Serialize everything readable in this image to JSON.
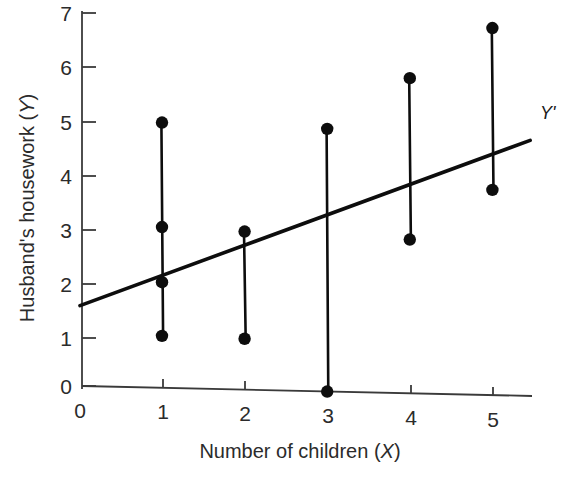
{
  "figure": {
    "name": "scatterplot-with-regression-line",
    "background_color": "#ffffff",
    "ink_color": "#0d0d0d"
  },
  "chart_data": {
    "type": "scatter",
    "title": "",
    "xlabel": "Number of children (X)",
    "ylabel": "Husband's housework (Y)",
    "xlabel_plain": "Number of children",
    "xlabel_italic_symbol": "X",
    "ylabel_plain": "Husband's housework",
    "ylabel_italic_symbol": "Y",
    "xlim": [
      0,
      5.45
    ],
    "ylim": [
      -0.15,
      7
    ],
    "xticks": [
      0,
      1,
      2,
      3,
      4,
      5
    ],
    "xtick_labels": [
      "0",
      "1",
      "2",
      "3",
      "4",
      "5"
    ],
    "yticks": [
      0,
      1,
      2,
      3,
      4,
      5,
      6,
      7
    ],
    "ytick_labels": [
      "0",
      "1",
      "2",
      "3",
      "4",
      "5",
      "6",
      "7"
    ],
    "grid": false,
    "legend": false,
    "x": [
      1,
      1,
      1,
      1,
      2,
      2,
      3,
      3,
      4,
      4,
      5,
      5
    ],
    "y": [
      4.95,
      3.0,
      1.97,
      0.97,
      2.95,
      0.95,
      4.9,
      0.0,
      5.88,
      2.87,
      6.85,
      3.83
    ],
    "points": [
      {
        "x": 1,
        "y": 4.95
      },
      {
        "x": 1,
        "y": 3.0
      },
      {
        "x": 1,
        "y": 1.97
      },
      {
        "x": 1,
        "y": 0.97
      },
      {
        "x": 2,
        "y": 2.95
      },
      {
        "x": 2,
        "y": 0.95
      },
      {
        "x": 3,
        "y": 4.9
      },
      {
        "x": 3,
        "y": 0.0
      },
      {
        "x": 4,
        "y": 5.88
      },
      {
        "x": 4,
        "y": 2.87
      },
      {
        "x": 5,
        "y": 6.85
      },
      {
        "x": 5,
        "y": 3.83
      }
    ],
    "residual_segments": [
      {
        "x": 1,
        "y_top": 4.95,
        "y_bottom": 0.97
      },
      {
        "x": 2,
        "y_top": 2.95,
        "y_bottom": 0.95
      },
      {
        "x": 3,
        "y_top": 4.9,
        "y_bottom": 0.0
      },
      {
        "x": 4,
        "y_top": 5.88,
        "y_bottom": 2.87
      },
      {
        "x": 5,
        "y_top": 6.85,
        "y_bottom": 3.83
      }
    ],
    "regression_line": {
      "label": "Y'",
      "intercept": 1.5,
      "slope": 0.6,
      "x_start": 0,
      "y_start": 1.5,
      "x_end": 5.45,
      "y_end": 4.77
    },
    "series": [
      {
        "name": "Observed pairs",
        "x": [
          1,
          1,
          1,
          1,
          2,
          2,
          3,
          3,
          4,
          4,
          5,
          5
        ],
        "values": [
          4.95,
          3.0,
          1.97,
          0.97,
          2.95,
          0.95,
          4.9,
          0.0,
          5.88,
          2.87,
          6.85,
          3.83
        ]
      },
      {
        "name": "Y'",
        "x": [
          0,
          5.45
        ],
        "values": [
          1.5,
          4.77
        ]
      }
    ]
  }
}
